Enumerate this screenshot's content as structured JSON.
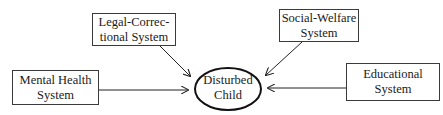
{
  "diagram": {
    "center": {
      "line1": "Disturbed",
      "line2": "Child"
    },
    "nodes": [
      {
        "id": "legal",
        "line1": "Legal-Correc-",
        "line2": "tional System"
      },
      {
        "id": "social",
        "line1": "Social-Welfare",
        "line2": "System"
      },
      {
        "id": "mental",
        "line1": "Mental Health",
        "line2": "System"
      },
      {
        "id": "educational",
        "line1": "Educational",
        "line2": "System"
      }
    ],
    "edges": [
      {
        "from": "legal",
        "to": "center"
      },
      {
        "from": "social",
        "to": "center"
      },
      {
        "from": "mental",
        "to": "center"
      },
      {
        "from": "educational",
        "to": "center"
      }
    ]
  }
}
